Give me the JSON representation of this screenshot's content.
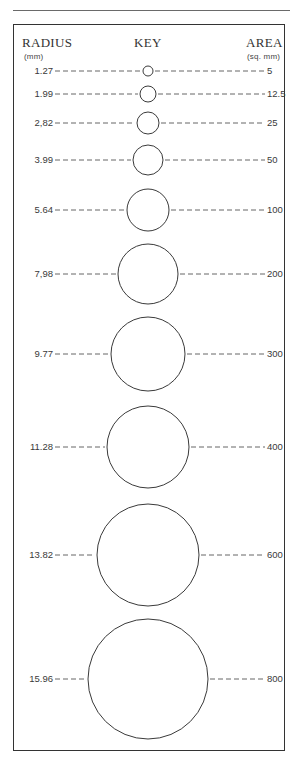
{
  "header": {
    "radius_title": "RADIUS",
    "radius_unit": "(mm)",
    "key_title": "KEY",
    "area_title": "AREA",
    "area_unit": "(sq. mm)"
  },
  "rows": [
    {
      "radius": "1.27",
      "area": "5",
      "cy": 71,
      "r": 5
    },
    {
      "radius": "1.99",
      "area": "12.5",
      "cy": 94,
      "r": 8
    },
    {
      "radius": "2,82",
      "area": "25",
      "cy": 123,
      "r": 11
    },
    {
      "radius": "3.99",
      "area": "50",
      "cy": 160,
      "r": 15
    },
    {
      "radius": "5.64",
      "area": "100",
      "cy": 210,
      "r": 21
    },
    {
      "radius": "7,98",
      "area": "200",
      "cy": 274,
      "r": 30
    },
    {
      "radius": "9.77",
      "area": "300",
      "cy": 354,
      "r": 37
    },
    {
      "radius": "11.28",
      "area": "400",
      "cy": 447,
      "r": 41
    },
    {
      "radius": "13.82",
      "area": "600",
      "cy": 555,
      "r": 51
    },
    {
      "radius": "15.96",
      "area": "800",
      "cy": 679,
      "r": 60
    }
  ],
  "colors": {
    "line": "#3a3a3a",
    "dash": "#555555",
    "frame": "#333333"
  }
}
